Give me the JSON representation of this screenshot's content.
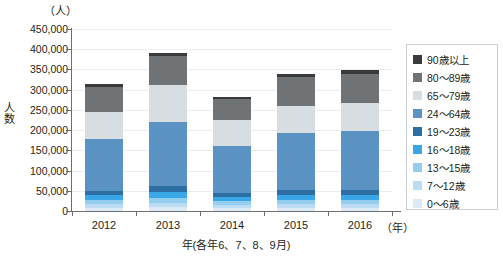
{
  "chart_data": {
    "type": "bar",
    "title": "",
    "subtitle": "",
    "stacked": true,
    "unit_top": "（人）",
    "ylabel": "人数",
    "xlabel": "年(各年6、7、8、9月)",
    "xunit": "（年）",
    "categories": [
      "2012",
      "2013",
      "2014",
      "2015",
      "2016"
    ],
    "ylim": [
      0,
      450000
    ],
    "ytick_step": 50000,
    "ytick_labels": [
      "450,000",
      "400,000",
      "350,000",
      "300,000",
      "250,000",
      "200,000",
      "150,000",
      "100,000",
      "50,000",
      "0"
    ],
    "ytick_values": [
      450000,
      400000,
      350000,
      300000,
      250000,
      200000,
      150000,
      100000,
      50000,
      0
    ],
    "grid": true,
    "legend_position": "right",
    "series": [
      {
        "name": "0〜6歳",
        "color": "#dceaf6",
        "values": [
          8000,
          9000,
          7000,
          8000,
          8000
        ]
      },
      {
        "name": "7〜12歳",
        "color": "#bcdcf3",
        "values": [
          10000,
          12000,
          9000,
          10000,
          10000
        ]
      },
      {
        "name": "13〜15歳",
        "color": "#93cdf0",
        "values": [
          9000,
          11000,
          8000,
          9000,
          9000
        ]
      },
      {
        "name": "16〜18歳",
        "color": "#39a7e6",
        "values": [
          12000,
          15000,
          11000,
          13000,
          13000
        ]
      },
      {
        "name": "19〜23歳",
        "color": "#2d6fa3",
        "values": [
          11000,
          14000,
          10000,
          12000,
          12000
        ]
      },
      {
        "name": "24〜64歳",
        "color": "#5b92c4",
        "values": [
          129000,
          159000,
          117000,
          142000,
          146000
        ]
      },
      {
        "name": "65〜79歳",
        "color": "#d7dde1",
        "values": [
          66000,
          92000,
          62000,
          67000,
          70000
        ]
      },
      {
        "name": "80〜89歳",
        "color": "#6f7376",
        "values": [
          62000,
          71000,
          54000,
          71000,
          72000
        ]
      },
      {
        "name": "90歳以上",
        "color": "#3a3a3c",
        "values": [
          8000,
          8000,
          5000,
          8000,
          8000
        ]
      }
    ],
    "totals": [
      315000,
      391000,
      283000,
      340000,
      348000
    ],
    "legend_order": [
      "90歳以上",
      "80〜89歳",
      "65〜79歳",
      "24〜64歳",
      "19〜23歳",
      "16〜18歳",
      "13〜15歳",
      "7〜12歳",
      "0〜6歳"
    ],
    "colors": {
      "axis": "#6d6e71",
      "grid": "#e9eef3",
      "text": "#231f20",
      "legend_border": "#c9ced3",
      "background": "#ffffff"
    }
  }
}
